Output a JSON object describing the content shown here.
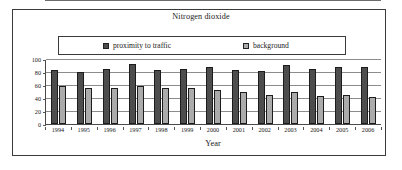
{
  "chart_data": {
    "type": "bar",
    "title": "Nitrogen dioxide",
    "xlabel": "Year",
    "ylabel": "",
    "ylim": [
      0,
      100
    ],
    "yticks": [
      0,
      20,
      40,
      60,
      80,
      100
    ],
    "grid": true,
    "legend_position": "top",
    "categories": [
      "1994",
      "1995",
      "1996",
      "1997",
      "1998",
      "1999",
      "2000",
      "2001",
      "2002",
      "2003",
      "2004",
      "2005",
      "2006"
    ],
    "series": [
      {
        "name": "proximity to traffic",
        "color": "#4d4d4d",
        "values": [
          83,
          80,
          85,
          92,
          83,
          85,
          87,
          83,
          82,
          91,
          85,
          87,
          87
        ]
      },
      {
        "name": "background",
        "color": "#ababab",
        "values": [
          59,
          55,
          55,
          58,
          56,
          55,
          52,
          50,
          45,
          50,
          43,
          44,
          41
        ]
      }
    ]
  },
  "legend": {
    "items": [
      {
        "label": "proximity to traffic",
        "swatch": "#4d4d4d"
      },
      {
        "label": "background",
        "swatch": "#ababab"
      }
    ]
  },
  "colors": {
    "traffic": "#4d4d4d",
    "background": "#ababab",
    "frame": "#3a3a3a",
    "gridline": "#8c8c8c",
    "text": "#1a1a1a",
    "page": "#ffffff"
  }
}
